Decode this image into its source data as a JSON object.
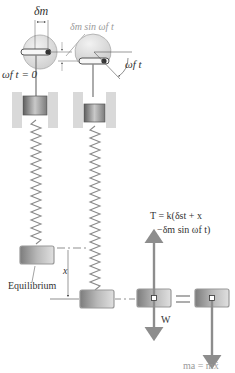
{
  "diagram": {
    "labels": {
      "delta_m": "δm",
      "delta_m_sub": "m",
      "delta_sin": "δm sin ωf t",
      "omega_t0": "ωf t = 0",
      "omega_t": "ωf t",
      "equilibrium": "Equilibrium",
      "x": "x",
      "tension_line1": "T = k(δst + x",
      "tension_line2": "−δm sin ωf t)",
      "weight": "W",
      "inertia": "ma = mẍ",
      "equals": "="
    },
    "colors": {
      "wheel": "#e6e6e6",
      "block": "#9a9a9a",
      "wall": "#d8d8d8",
      "spring": "#8a8a8a",
      "arrow": "#8d8d8d",
      "text": "#333333",
      "dim_text": "#9a9a9a"
    }
  }
}
